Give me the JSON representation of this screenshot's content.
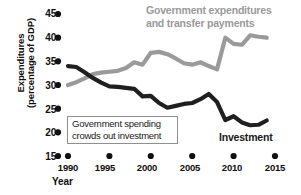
{
  "chart_data": {
    "type": "line",
    "title": "",
    "xlabel": "Year",
    "ylabel": "Expenditures (percentage of GDP)",
    "ylabel_line1": "Expenditures",
    "ylabel_line2": "(percentage of GDP)",
    "xlim": [
      1990,
      2015
    ],
    "ylim": [
      15,
      45
    ],
    "xticks": [
      1990,
      1995,
      2000,
      2005,
      2010,
      2015
    ],
    "yticks": [
      15,
      20,
      25,
      30,
      35,
      40,
      45
    ],
    "grid": false,
    "legend_position": "inline-annotations",
    "tick_style": "dot-markers",
    "colors": {
      "government": "#9a9a9a",
      "investment": "#1f1f1f",
      "axis_text": "#101010",
      "callout_border": "#8f8f8f",
      "background": "#ffffff"
    },
    "series": [
      {
        "name": "Government expenditures and transfer payments",
        "label_line1": "Government expenditures",
        "label_line2": "and transfer payments",
        "color": "#9a9a9a",
        "x": [
          1990,
          1991,
          1992,
          1993,
          1994,
          1995,
          1996,
          1997,
          1998,
          1999,
          2000,
          2001,
          2002,
          2003,
          2004,
          2005,
          2006,
          2007,
          2008,
          2009,
          2010,
          2011,
          2012,
          2013,
          2014
        ],
        "values": [
          30.0,
          30.6,
          31.4,
          32.3,
          32.6,
          32.8,
          33.0,
          33.6,
          34.8,
          34.3,
          36.8,
          37.0,
          36.5,
          35.6,
          34.6,
          34.3,
          34.8,
          34.0,
          33.3,
          40.0,
          38.7,
          38.5,
          40.5,
          40.2,
          40.0
        ]
      },
      {
        "name": "Investment",
        "label": "Investment",
        "color": "#1f1f1f",
        "x": [
          1990,
          1991,
          1992,
          1993,
          1994,
          1995,
          1996,
          1997,
          1998,
          1999,
          2000,
          2001,
          2002,
          2003,
          2004,
          2005,
          2006,
          2007,
          2008,
          2009,
          2010,
          2011,
          2012,
          2013,
          2014
        ],
        "values": [
          34.0,
          33.8,
          32.7,
          31.5,
          30.5,
          29.7,
          29.6,
          29.4,
          29.2,
          27.6,
          27.7,
          26.2,
          25.2,
          25.6,
          26.0,
          26.2,
          27.0,
          28.1,
          26.4,
          22.6,
          23.4,
          22.1,
          21.5,
          21.6,
          22.5
        ]
      }
    ],
    "annotations": [
      {
        "id": "callout",
        "line1": "Government spending",
        "line2": "crowds out investment"
      }
    ]
  },
  "axis": {
    "ytick_labels": [
      "45",
      "40",
      "35",
      "30",
      "25",
      "20",
      "15"
    ],
    "xtick_labels": [
      "1990",
      "1995",
      "2000",
      "2005",
      "2010",
      "2015"
    ],
    "x_title": "Year"
  }
}
